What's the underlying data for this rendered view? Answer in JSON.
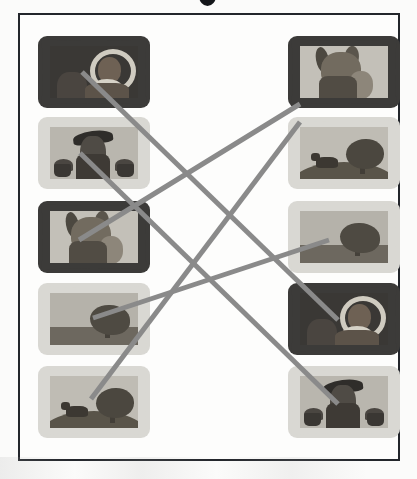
{
  "document": {
    "kind": "matching-exercise-worksheet",
    "partial_title_glyph": "•",
    "media": "grayscale scanned page"
  },
  "colors": {
    "page_background": "#fbfbfa",
    "border": "#23262b",
    "connector_line": "#8a8a8a",
    "dark_frame": "#3c3b39",
    "light_frame": "#d9d8d3"
  },
  "columns": {
    "left": {
      "name": "left-column",
      "items": [
        {
          "id": "L1",
          "art": "haloed-saint",
          "frame": "dark",
          "alt": "Framed picture of a haloed saint figure on a dark ground"
        },
        {
          "id": "L2",
          "art": "figure-with-flowers",
          "frame": "light",
          "alt": "Framed picture of a hatted figure flanked by two potted flowers"
        },
        {
          "id": "L3",
          "art": "horned-figure",
          "frame": "dark",
          "alt": "Framed picture of a horned helmeted figure holding a shield"
        },
        {
          "id": "L4",
          "art": "bush-landscape",
          "frame": "light",
          "alt": "Framed landscape picture with a single bushy tree"
        },
        {
          "id": "L5",
          "art": "cow-and-tree-hill",
          "frame": "light",
          "alt": "Framed landscape picture with a cow and a tree on a hill"
        }
      ]
    },
    "right": {
      "name": "right-column",
      "items": [
        {
          "id": "R1",
          "art": "horned-figure",
          "frame": "dark",
          "alt": "Framed picture of a horned helmeted figure holding a shield"
        },
        {
          "id": "R2",
          "art": "cow-and-tree-hill",
          "frame": "light",
          "alt": "Framed landscape picture with a cow and a tree on a hill"
        },
        {
          "id": "R3",
          "art": "bush-landscape",
          "frame": "light",
          "alt": "Framed landscape picture with a single bushy tree"
        },
        {
          "id": "R4",
          "art": "haloed-saint",
          "frame": "dark",
          "alt": "Framed picture of a haloed saint figure on a dark ground"
        },
        {
          "id": "R5",
          "art": "figure-with-flowers",
          "frame": "light",
          "alt": "Framed picture of a hatted figure flanked by two potted flowers"
        }
      ]
    }
  },
  "connections": {
    "count": 5,
    "stroke_width": 5,
    "lines": [
      {
        "from": "L1",
        "to": "R4",
        "x1": 82,
        "y1": 72,
        "x2": 338,
        "y2": 320
      },
      {
        "from": "L2",
        "to": "R5",
        "x1": 80,
        "y1": 153,
        "x2": 338,
        "y2": 404
      },
      {
        "from": "L3",
        "to": "R1",
        "x1": 79,
        "y1": 240,
        "x2": 300,
        "y2": 104
      },
      {
        "from": "L4",
        "to": "R3",
        "x1": 93,
        "y1": 318,
        "x2": 329,
        "y2": 240
      },
      {
        "from": "L5",
        "to": "R2",
        "x1": 91,
        "y1": 399,
        "x2": 300,
        "y2": 122
      }
    ]
  }
}
